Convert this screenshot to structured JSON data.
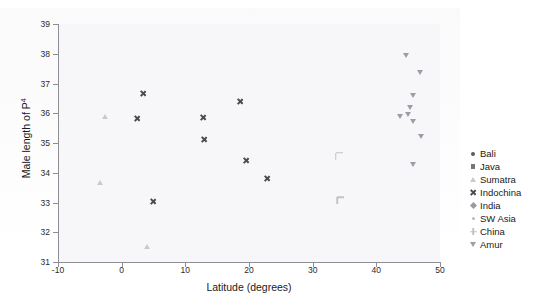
{
  "chart_data": {
    "type": "scatter",
    "title": "",
    "xlabel": "Latitude (degrees)",
    "ylabel": "Male length of P4",
    "xlim": [
      -10,
      50
    ],
    "ylim": [
      31,
      39
    ],
    "xticks": [
      "-10",
      "0",
      "10",
      "20",
      "30",
      "40",
      "50"
    ],
    "yticks": [
      "31",
      "32",
      "33",
      "34",
      "35",
      "36",
      "37",
      "38",
      "39"
    ],
    "grid": false,
    "legend_position": "right",
    "series": [
      {
        "name": "Bali",
        "marker": "circle",
        "color": "#5a5a60",
        "points": [
          [
            -7.8,
            33.85
          ]
        ]
      },
      {
        "name": "Java",
        "marker": "square",
        "color": "#75757c",
        "points": [
          [
            -7.2,
            35.52
          ],
          [
            -7.4,
            34.45
          ],
          [
            -7.1,
            33.87
          ],
          [
            -7.2,
            33.55
          ],
          [
            -6.9,
            33.52
          ]
        ]
      },
      {
        "name": "Sumatra",
        "marker": "triangle",
        "color": "#c9c9d2",
        "points": [
          [
            -2.6,
            36.25
          ],
          [
            -3.4,
            34.02
          ],
          [
            4.0,
            31.88
          ]
        ]
      },
      {
        "name": "Indochina",
        "marker": "x",
        "color": "#4a4a50",
        "points": [
          [
            3.3,
            36.78
          ],
          [
            2.4,
            35.95
          ],
          [
            12.8,
            35.98
          ],
          [
            13.0,
            35.22
          ],
          [
            18.6,
            36.52
          ],
          [
            19.6,
            34.52
          ],
          [
            22.9,
            33.92
          ],
          [
            4.9,
            33.15
          ]
        ]
      },
      {
        "name": "India",
        "marker": "diamond",
        "color": "#9a9aa6",
        "points": [
          [
            28.0,
            37.95
          ],
          [
            26.9,
            37.48
          ],
          [
            26.0,
            37.12
          ],
          [
            25.6,
            37.05
          ],
          [
            27.6,
            36.82
          ],
          [
            24.0,
            36.62
          ],
          [
            25.9,
            36.72
          ],
          [
            26.5,
            36.58
          ],
          [
            22.6,
            36.22
          ],
          [
            26.4,
            36.05
          ],
          [
            25.4,
            35.48
          ],
          [
            27.6,
            35.22
          ],
          [
            26.3,
            34.85
          ],
          [
            20.6,
            34.42
          ],
          [
            22.7,
            34.45
          ],
          [
            24.3,
            33.95
          ],
          [
            19.3,
            34.55
          ],
          [
            19.2,
            34.35
          ],
          [
            29.2,
            36.38
          ]
        ]
      },
      {
        "name": "SW Asia",
        "marker": "dot",
        "color": "#b9b9c4",
        "points": [
          [
            35.5,
            36.52
          ],
          [
            33.9,
            35.48
          ],
          [
            43.0,
            35.62
          ],
          [
            44.8,
            35.92
          ],
          [
            45.8,
            36.18
          ],
          [
            44.2,
            35.55
          ],
          [
            41.4,
            36.08
          ],
          [
            51.0,
            36.25
          ]
        ]
      },
      {
        "name": "China",
        "marker": "plus",
        "color": "#c2c2cc",
        "points": [
          [
            33.6,
            34.68
          ],
          [
            33.9,
            33.18
          ]
        ]
      },
      {
        "name": "Amur",
        "marker": "dtriangle",
        "color": "#9d9daa",
        "points": [
          [
            44.6,
            37.55
          ],
          [
            46.8,
            36.98
          ],
          [
            45.7,
            36.22
          ],
          [
            45.3,
            35.82
          ],
          [
            44.9,
            35.58
          ],
          [
            43.7,
            35.52
          ],
          [
            45.8,
            35.32
          ],
          [
            47.0,
            34.82
          ],
          [
            45.8,
            33.88
          ]
        ]
      }
    ]
  },
  "legend": {
    "items": [
      {
        "label": "Bali",
        "marker": "circle",
        "color": "#5a5a60"
      },
      {
        "label": "Java",
        "marker": "square",
        "color": "#75757c"
      },
      {
        "label": "Sumatra",
        "marker": "triangle",
        "color": "#c9c9d2"
      },
      {
        "label": "Indochina",
        "marker": "x",
        "color": "#4a4a50"
      },
      {
        "label": "India",
        "marker": "diamond",
        "color": "#9a9aa6"
      },
      {
        "label": "SW Asia",
        "marker": "dot",
        "color": "#b9b9c4"
      },
      {
        "label": "China",
        "marker": "plus",
        "color": "#c2c2cc"
      },
      {
        "label": "Amur",
        "marker": "dtriangle",
        "color": "#9d9daa"
      }
    ]
  },
  "axis": {
    "x_title": "Latitude (degrees)",
    "y_title_main": "Male length of P",
    "y_title_sup": "4"
  }
}
